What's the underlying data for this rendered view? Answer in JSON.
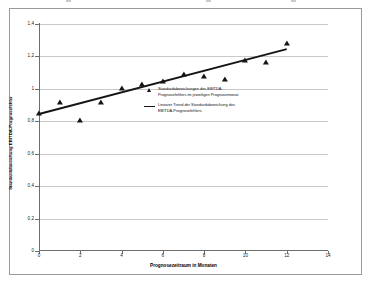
{
  "chart_data": {
    "type": "scatter",
    "title": "",
    "xlabel": "Prognosezeitraum in Monaten",
    "ylabel": "Standardabweichung EBITDA-Prognosefehler",
    "xlim": [
      0,
      14
    ],
    "ylim": [
      0,
      1.4
    ],
    "grid": true,
    "legend_position": "center",
    "x_ticks": [
      "0",
      "2",
      "4",
      "6",
      "8",
      "10",
      "12",
      "14"
    ],
    "x_tick_values": [
      0,
      2,
      4,
      6,
      8,
      10,
      12,
      14
    ],
    "y_ticks": [
      "0",
      "0,2",
      "0,4",
      "0,6",
      "0,8",
      "1",
      "1,2",
      "1,4"
    ],
    "y_tick_values": [
      0,
      0.2,
      0.4,
      0.6,
      0.8,
      1.0,
      1.2,
      1.4
    ],
    "x": [
      0,
      1,
      2,
      3,
      4,
      5,
      6,
      7,
      8,
      9,
      10,
      11,
      12
    ],
    "series": [
      {
        "name": "Standardabweichungen des EBITDA-Prognosefehlers im jeweiligen Prognosemonat",
        "type": "scatter",
        "marker": "triangle",
        "color": "#151515",
        "values": [
          0.845,
          0.91,
          0.8,
          0.915,
          1.0,
          1.025,
          1.045,
          1.085,
          1.075,
          1.055,
          1.17,
          1.16,
          1.275
        ]
      },
      {
        "name": "Linearer Trend der Standardabweichung des EBITDA-Prognosefehlers",
        "type": "line",
        "color": "#151515",
        "x_endpoints": [
          0,
          12
        ],
        "y_endpoints": [
          0.845,
          1.245
        ]
      }
    ]
  },
  "legend": {
    "entries": [
      {
        "marker": "triangle-marker",
        "line1": "Standardabweichungen des EBITDA-",
        "line2": "Prognosefehlers im jeweiligen Prognosemonat"
      },
      {
        "marker": "line-marker",
        "line1": "Linearer Trend der Standardabweichung des",
        "line2": "EBITDA-Prognosefehlers"
      }
    ]
  },
  "axes": {
    "x_title": "Prognosezeitraum in Monaten",
    "y_title": "Standardabweichung EBITDA-Prognosefehler"
  },
  "colors": {
    "marker": "#151515",
    "trend_line": "#151515",
    "gridline": "#c9c9c9",
    "axis": "#6e6e6e",
    "frame": "#9a9a9a",
    "background": "#ffffff"
  }
}
